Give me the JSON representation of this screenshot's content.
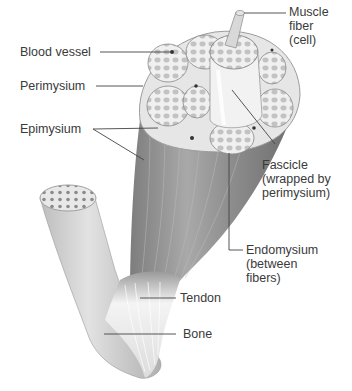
{
  "diagram": {
    "labels": {
      "muscle_fiber": "Muscle\nfiber\n(cell)",
      "blood_vessel": "Blood vessel",
      "perimysium": "Perimysium",
      "epimysium": "Epimysium",
      "fascicle": "Fascicle\n(wrapped by\nperimysium)",
      "endomysium": "Endomysium\n(between\nfibers)",
      "tendon": "Tendon",
      "bone": "Bone"
    },
    "colors": {
      "text": "#3a3a3a",
      "leader_line": "#444444",
      "muscle_dark": "#8a8a8a",
      "muscle_light": "#c8c8c8",
      "fascicle_fill": "#eeeeee",
      "fiber_dot": "#b5b5b5",
      "bone": "#d0d0d0",
      "tendon": "#f2f2f2"
    }
  }
}
